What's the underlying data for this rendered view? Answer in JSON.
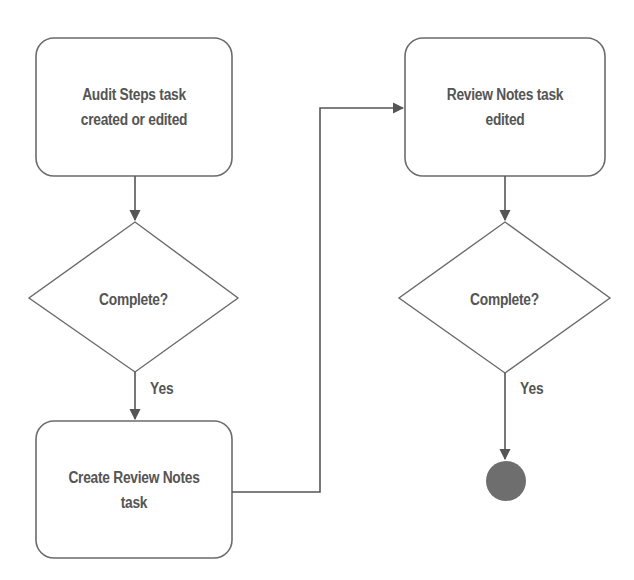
{
  "diagram": {
    "type": "flowchart",
    "colors": {
      "stroke": "#6b6b6b",
      "text": "#555555",
      "end_node_fill": "#6e6e6e",
      "background": "#ffffff"
    },
    "nodes": [
      {
        "id": "audit-steps",
        "shape": "rounded-rect",
        "label_line1": "Audit Steps task",
        "label_line2": "created or edited"
      },
      {
        "id": "complete-1",
        "shape": "diamond",
        "label": "Complete?"
      },
      {
        "id": "create-review-notes",
        "shape": "rounded-rect",
        "label_line1": "Create Review Notes",
        "label_line2": "task"
      },
      {
        "id": "review-notes-edited",
        "shape": "rounded-rect",
        "label_line1": "Review Notes task",
        "label_line2": "edited"
      },
      {
        "id": "complete-2",
        "shape": "diamond",
        "label": "Complete?"
      },
      {
        "id": "end",
        "shape": "filled-circle",
        "label": ""
      }
    ],
    "edges": [
      {
        "from": "audit-steps",
        "to": "complete-1",
        "label": ""
      },
      {
        "from": "complete-1",
        "to": "create-review-notes",
        "label": "Yes"
      },
      {
        "from": "create-review-notes",
        "to": "review-notes-edited",
        "label": ""
      },
      {
        "from": "review-notes-edited",
        "to": "complete-2",
        "label": ""
      },
      {
        "from": "complete-2",
        "to": "end",
        "label": "Yes"
      }
    ]
  }
}
